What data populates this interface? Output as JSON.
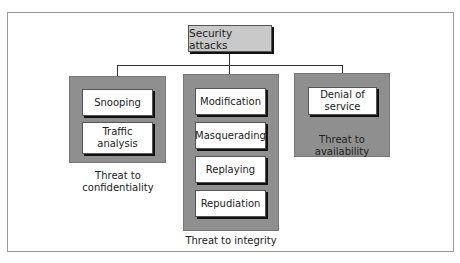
{
  "diagram": {
    "type": "hierarchy-tree",
    "root": {
      "label": "Security attacks"
    },
    "groups": [
      {
        "id": "confidentiality",
        "caption_line1": "Threat to",
        "caption_line2": "confidentiality",
        "items": [
          {
            "label": "Snooping"
          },
          {
            "label_line1": "Traffic",
            "label_line2": "analysis"
          }
        ]
      },
      {
        "id": "integrity",
        "caption": "Threat to integrity",
        "items": [
          {
            "label": "Modification"
          },
          {
            "label": "Masquerading"
          },
          {
            "label": "Replaying"
          },
          {
            "label": "Repudiation"
          }
        ]
      },
      {
        "id": "availability",
        "caption_line1": "Threat to",
        "caption_line2": "availability",
        "items": [
          {
            "label_line1": "Denial of",
            "label_line2": "service"
          }
        ]
      }
    ],
    "colors": {
      "root_fill": "#c9c9c9",
      "panel_fill": "#8f8f8f",
      "leaf_fill": "#ffffff",
      "line": "#333333",
      "frame_border": "#9a9a9a"
    }
  }
}
